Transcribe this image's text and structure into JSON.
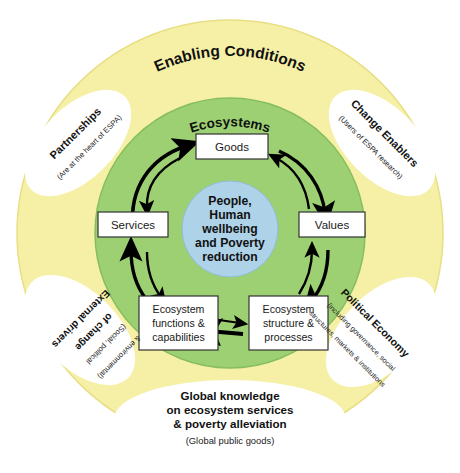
{
  "colors": {
    "outer_ring": "#F6F0A6",
    "outer_ring_stroke": "#E8DF84",
    "inner_ring": "#9DD073",
    "inner_ring_stroke": "#87BE5C",
    "center_circle": "#AED2E8",
    "center_circle_stroke": "#8FBCD8",
    "satellite_fill": "#FFFFFF",
    "box_fill": "#FFFFFF",
    "box_stroke": "#333333",
    "arrow": "#000000",
    "text": "#111111",
    "background": "#FFFFFF"
  },
  "rings": {
    "outer_title": "Enabling Conditions",
    "inner_title": "Ecosystems"
  },
  "center": {
    "lines": [
      "People,",
      "Human",
      "wellbeing",
      "and Poverty",
      "reduction"
    ]
  },
  "cycle_boxes": [
    {
      "id": "goods",
      "label": "Goods",
      "lines": [
        "Goods"
      ]
    },
    {
      "id": "values",
      "label": "Values",
      "lines": [
        "Values"
      ]
    },
    {
      "id": "services",
      "label": "Services",
      "lines": [
        "Services"
      ]
    },
    {
      "id": "ecosystem-functions",
      "label": "Ecosystem functions & capabilities",
      "lines": [
        "Ecosystem",
        "functions &",
        "capabilities"
      ]
    },
    {
      "id": "ecosystem-structure",
      "label": "Ecosystem structure & processes",
      "lines": [
        "Ecosystem",
        "structure &",
        "processes"
      ]
    }
  ],
  "satellites": [
    {
      "id": "partnerships",
      "title": "Partnerships",
      "subtitle_lines": [
        "(Are at the heart of ESPA)"
      ],
      "position": "top-left"
    },
    {
      "id": "change-enablers",
      "title": "Change Enablers",
      "subtitle_lines": [
        "(Users of ESPA research)"
      ],
      "position": "top-right"
    },
    {
      "id": "external-drivers",
      "title_lines": [
        "External drivers",
        "of change"
      ],
      "title": "External drivers of change",
      "subtitle_lines": [
        "(Social, political",
        "& environmental)"
      ],
      "position": "bottom-left"
    },
    {
      "id": "political-economy",
      "title": "Political Economy",
      "subtitle_lines": [
        "(including governance, social",
        "structures, markets & institutions)"
      ],
      "position": "bottom-right"
    }
  ],
  "bottom_banner": {
    "id": "global-knowledge",
    "title_lines": [
      "Global knowledge",
      "on ecosystem services",
      "& poverty alleviation"
    ],
    "subtitle": "(Global public goods)"
  },
  "arrows": {
    "count": 10,
    "description": "bidirectional curved arrows linking cycle boxes clockwise and counter-clockwise"
  }
}
